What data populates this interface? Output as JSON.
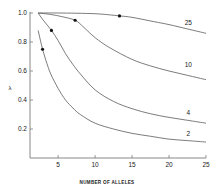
{
  "chart_data": {
    "type": "line",
    "title": "",
    "xlabel": "NUMBER OF ALLELES",
    "ylabel": "λ",
    "xlim": [
      1.2,
      25
    ],
    "ylim": [
      0,
      1.0
    ],
    "x_ticks": [
      5,
      10,
      15,
      20,
      25
    ],
    "x_tick_labels": [
      "5",
      "10",
      "15",
      "20",
      "25"
    ],
    "y_ticks": [
      0.2,
      0.4,
      0.6,
      0.8,
      1.0
    ],
    "y_tick_labels": [
      "0.2",
      "0.4",
      "0.6",
      "0.8",
      "1.0"
    ],
    "grid": false,
    "legend": "inline curve labels at right",
    "series": [
      {
        "name": "25",
        "points": [
          [
            2.3,
            1.0
          ],
          [
            5,
            1.0
          ],
          [
            10,
            0.995
          ],
          [
            13.3,
            0.98
          ],
          [
            15,
            0.97
          ],
          [
            18,
            0.94
          ],
          [
            20,
            0.92
          ],
          [
            22.5,
            0.89
          ],
          [
            25,
            0.86
          ]
        ],
        "marker": [
          13.3,
          0.98
        ]
      },
      {
        "name": "10",
        "points": [
          [
            2.3,
            1.0
          ],
          [
            4,
            0.99
          ],
          [
            5.5,
            0.975
          ],
          [
            7.3,
            0.95
          ],
          [
            8.5,
            0.9
          ],
          [
            10,
            0.83
          ],
          [
            12,
            0.76
          ],
          [
            15,
            0.68
          ],
          [
            17.5,
            0.635
          ],
          [
            20,
            0.6
          ],
          [
            22.5,
            0.57
          ],
          [
            25,
            0.54
          ]
        ],
        "marker": [
          7.3,
          0.95
        ]
      },
      {
        "name": "4",
        "points": [
          [
            2.3,
            1.0
          ],
          [
            3,
            0.95
          ],
          [
            4.1,
            0.88
          ],
          [
            5,
            0.81
          ],
          [
            6,
            0.72
          ],
          [
            7,
            0.645
          ],
          [
            8,
            0.58
          ],
          [
            10,
            0.47
          ],
          [
            12.5,
            0.39
          ],
          [
            15,
            0.34
          ],
          [
            17.5,
            0.305
          ],
          [
            20,
            0.28
          ],
          [
            22.5,
            0.26
          ],
          [
            25,
            0.24
          ]
        ],
        "marker": [
          4.1,
          0.88
        ]
      },
      {
        "name": "2",
        "points": [
          [
            2.3,
            0.88
          ],
          [
            2.9,
            0.75
          ],
          [
            3.5,
            0.65
          ],
          [
            4,
            0.58
          ],
          [
            5,
            0.48
          ],
          [
            6,
            0.4
          ],
          [
            7,
            0.345
          ],
          [
            8,
            0.3
          ],
          [
            10,
            0.24
          ],
          [
            12.5,
            0.2
          ],
          [
            15,
            0.17
          ],
          [
            17.5,
            0.15
          ],
          [
            20,
            0.13
          ],
          [
            22.5,
            0.12
          ],
          [
            25,
            0.11
          ]
        ],
        "marker": [
          2.9,
          0.75
        ]
      }
    ]
  },
  "plot_area": {
    "x_origin_px": 30,
    "x_end_px": 206,
    "y_top_px": 13,
    "y_bottom_px": 158
  },
  "curve_label_positions": {
    "25": [
      22.6,
      0.92
    ],
    "10": [
      22.6,
      0.63
    ],
    "4": [
      22.6,
      0.3
    ],
    "2": [
      22.6,
      0.15
    ]
  },
  "colors": {
    "line": "#5a5a5a",
    "axis": "#6a6a6a",
    "marker": "#111111",
    "text": "#1a1a1a"
  }
}
